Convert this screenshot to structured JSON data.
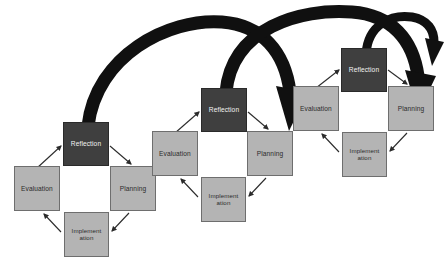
{
  "diagram": {
    "background_color": "#ffffff",
    "node_fill_light": "#b4b4b4",
    "node_fill_dark": "#3f3f3f",
    "node_border_color": "#6e6e6e",
    "arc_color": "#101010",
    "connector_color": "#2b2b2b",
    "cycles": [
      {
        "name": "cycle-1",
        "nodes": [
          {
            "id": "reflection",
            "label": "Reflection",
            "style": "dark",
            "x": 63,
            "y": 122,
            "w": 46,
            "h": 44,
            "font_size": 6.6
          },
          {
            "id": "evaluation",
            "label": "Evaluation",
            "style": "light",
            "x": 14,
            "y": 166,
            "w": 46,
            "h": 45,
            "font_size": 6.6
          },
          {
            "id": "planning",
            "label": "Planning",
            "style": "light",
            "x": 110,
            "y": 166,
            "w": 46,
            "h": 45,
            "font_size": 6.6
          },
          {
            "id": "implementation",
            "label": "Implement ation",
            "style": "light",
            "x": 64,
            "y": 212,
            "w": 45,
            "h": 45,
            "font_size": 6.2
          }
        ]
      },
      {
        "name": "cycle-2",
        "nodes": [
          {
            "id": "reflection",
            "label": "Reflection",
            "style": "dark",
            "x": 201,
            "y": 88,
            "w": 46,
            "h": 44,
            "font_size": 6.6
          },
          {
            "id": "evaluation",
            "label": "Evaluation",
            "style": "light",
            "x": 152,
            "y": 131,
            "w": 46,
            "h": 45,
            "font_size": 6.6
          },
          {
            "id": "planning",
            "label": "Planning",
            "style": "light",
            "x": 247,
            "y": 131,
            "w": 46,
            "h": 45,
            "font_size": 6.6
          },
          {
            "id": "implementation",
            "label": "Implement ation",
            "style": "light",
            "x": 201,
            "y": 177,
            "w": 45,
            "h": 45,
            "font_size": 6.2
          }
        ]
      },
      {
        "name": "cycle-3",
        "nodes": [
          {
            "id": "reflection",
            "label": "Reflection",
            "style": "dark",
            "x": 341,
            "y": 48,
            "w": 46,
            "h": 44,
            "font_size": 6.6
          },
          {
            "id": "evaluation",
            "label": "Evaluation",
            "style": "light",
            "x": 293,
            "y": 86,
            "w": 46,
            "h": 45,
            "font_size": 6.6
          },
          {
            "id": "planning",
            "label": "Planning",
            "style": "light",
            "x": 388,
            "y": 86,
            "w": 46,
            "h": 45,
            "font_size": 6.6
          },
          {
            "id": "implementation",
            "label": "Implement ation",
            "style": "light",
            "x": 342,
            "y": 132,
            "w": 45,
            "h": 45,
            "font_size": 6.2
          }
        ]
      }
    ],
    "spiral_arcs": [
      {
        "name": "arc-cycle1-to-cycle2",
        "from": "cycle-1 reflection",
        "to": "cycle-2 planning"
      },
      {
        "name": "arc-cycle2-to-cycle3",
        "from": "cycle-2 reflection",
        "to": "cycle-3 planning"
      },
      {
        "name": "arc-cycle3-onward",
        "from": "cycle-3 reflection",
        "to": "next cycle"
      }
    ]
  }
}
